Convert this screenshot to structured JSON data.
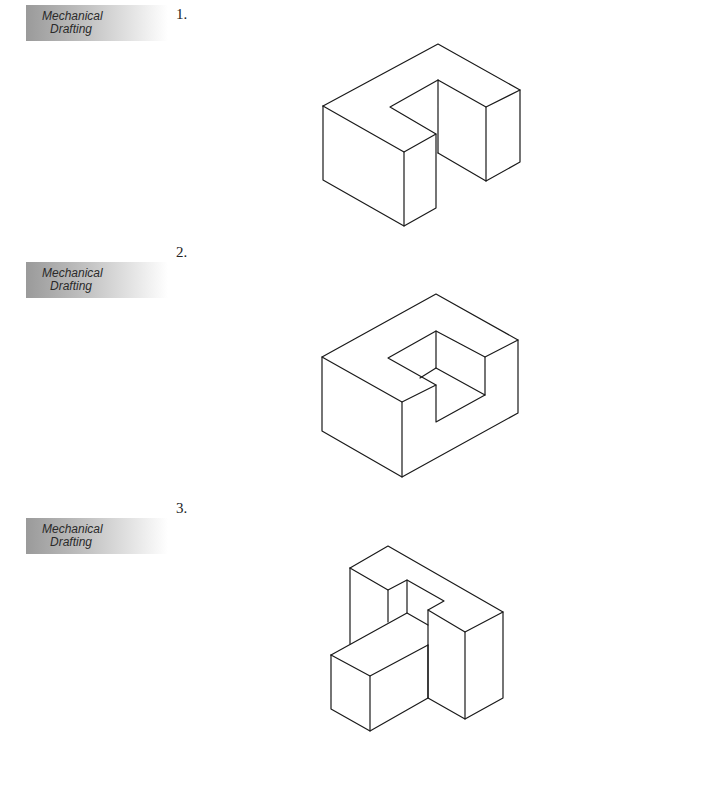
{
  "problems": [
    {
      "number": "1.",
      "tab": {
        "line1": "Mechanical",
        "line2": "Drafting"
      }
    },
    {
      "number": "2.",
      "tab": {
        "line1": "Mechanical",
        "line2": "Drafting"
      }
    },
    {
      "number": "3.",
      "tab": {
        "line1": "Mechanical",
        "line2": "Drafting"
      }
    }
  ]
}
